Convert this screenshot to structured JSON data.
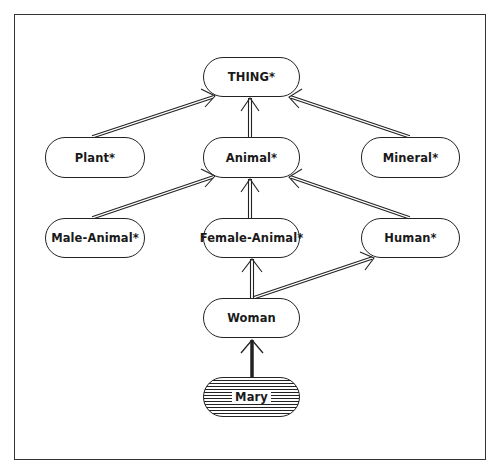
{
  "diagram": {
    "type": "is-a hierarchy",
    "nodes": {
      "thing": {
        "label": "THING*",
        "x": 203,
        "y": 57,
        "w": 97,
        "h": 40
      },
      "plant": {
        "label": "Plant*",
        "x": 45,
        "y": 137,
        "w": 100,
        "h": 41
      },
      "animal": {
        "label": "Animal*",
        "x": 203,
        "y": 137,
        "w": 97,
        "h": 41
      },
      "mineral": {
        "label": "Mineral*",
        "x": 361,
        "y": 137,
        "w": 99,
        "h": 41
      },
      "male_animal": {
        "label": "Male-Animal*",
        "x": 45,
        "y": 218,
        "w": 100,
        "h": 40
      },
      "female_animal": {
        "label": "Female-Animal*",
        "x": 203,
        "y": 218,
        "w": 97,
        "h": 40
      },
      "human": {
        "label": "Human*",
        "x": 361,
        "y": 218,
        "w": 99,
        "h": 40
      },
      "woman": {
        "label": "Woman",
        "x": 203,
        "y": 298,
        "w": 97,
        "h": 40
      },
      "mary": {
        "label": "Mary",
        "x": 203,
        "y": 377,
        "w": 97,
        "h": 40,
        "style": "hatched"
      }
    },
    "edges": [
      {
        "from": "plant",
        "to": "thing",
        "style": "double"
      },
      {
        "from": "animal",
        "to": "thing",
        "style": "double"
      },
      {
        "from": "mineral",
        "to": "thing",
        "style": "double"
      },
      {
        "from": "male_animal",
        "to": "animal",
        "style": "double"
      },
      {
        "from": "female_animal",
        "to": "animal",
        "style": "double"
      },
      {
        "from": "human",
        "to": "animal",
        "style": "double"
      },
      {
        "from": "woman",
        "to": "female_animal",
        "style": "double"
      },
      {
        "from": "woman",
        "to": "human",
        "style": "double"
      },
      {
        "from": "mary",
        "to": "woman",
        "style": "single-thick"
      }
    ]
  }
}
